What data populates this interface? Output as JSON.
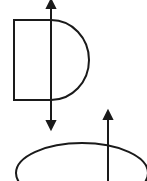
{
  "diagram": {
    "background": "#ffffff",
    "stroke_color": "#1a1a1a",
    "shapes": [
      {
        "name": "d-shape",
        "type": "semicircle-rectangle",
        "left": 14,
        "top": 20,
        "bottom": 100,
        "flat_right": 51,
        "arc_right": 89
      },
      {
        "name": "ellipse",
        "type": "ellipse",
        "cx": 82,
        "cy": 173,
        "rx": 66,
        "ry": 30
      }
    ],
    "arrows": [
      {
        "name": "vertical-arrow-1",
        "x": 51,
        "y_start": 128,
        "y_end": 1,
        "heads": [
          "up",
          "down"
        ]
      },
      {
        "name": "vertical-arrow-2",
        "x": 108,
        "y_start": 181,
        "y_end": 112,
        "heads": [
          "up"
        ]
      }
    ]
  }
}
